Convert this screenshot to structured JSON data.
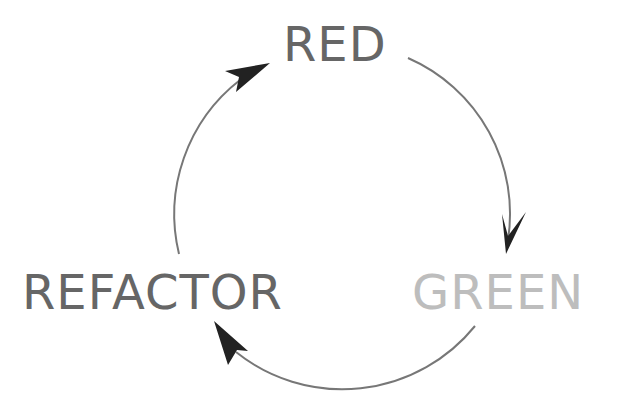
{
  "diagram": {
    "nodes": [
      {
        "id": "red",
        "label": "RED",
        "color": "#666666"
      },
      {
        "id": "green",
        "label": "GREEN",
        "color": "#bdbdbd"
      },
      {
        "id": "refactor",
        "label": "REFACTOR",
        "color": "#666666"
      }
    ],
    "edges": [
      {
        "from": "red",
        "to": "green",
        "icon": "arrow-clockwise"
      },
      {
        "from": "green",
        "to": "refactor",
        "icon": "arrow-clockwise"
      },
      {
        "from": "refactor",
        "to": "red",
        "icon": "arrow-clockwise"
      }
    ],
    "colors": {
      "arc": "#777777",
      "arrowhead": "#222222"
    }
  }
}
